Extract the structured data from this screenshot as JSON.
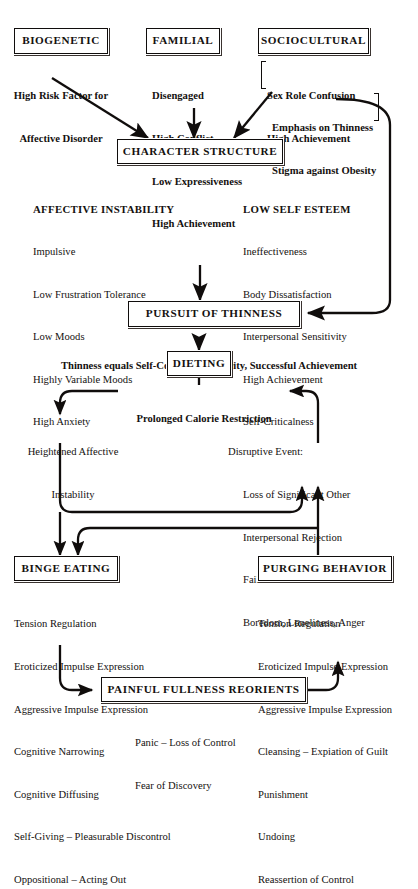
{
  "nodes": {
    "biogenetic": "BIOGENETIC",
    "familial": "FAMILIAL",
    "sociocultural": "SOCIOCULTURAL",
    "character_structure": "CHARACTER STRUCTURE",
    "pursuit_of_thinness": "PURSUIT OF THINNESS",
    "dieting": "DIETING",
    "binge_eating": "BINGE EATING",
    "purging_behavior": "PURGING BEHAVIOR",
    "painful_fullness": "PAINFUL FULLNESS REORIENTS"
  },
  "biogenetic_items": [
    "High Risk Factor for",
    "Affective Disorder"
  ],
  "familial_items": [
    "Disengaged",
    "High Conflict",
    "Low Expressiveness",
    "High Achievement"
  ],
  "sociocultural_group_a": [
    "Sex Role Confusion",
    "High Achievement"
  ],
  "sociocultural_group_b": [
    "Emphasis on Thinness",
    "Stigma against Obesity"
  ],
  "affective_instability": {
    "heading": "AFFECTIVE INSTABILITY",
    "items": [
      "Impulsive",
      "Low Frustration Tolerance",
      "Low Moods",
      "Highly Variable Moods",
      "High Anxiety"
    ]
  },
  "low_self_esteem": {
    "heading": "LOW SELF ESTEEM",
    "items": [
      "Ineffectiveness",
      "Body Dissatisfaction",
      "Interpersonal Sensitivity",
      "High Achievement",
      "Self-Criticalness"
    ]
  },
  "thinness_caption": "Thinness equals Self-Control, Popularity, Successful Achievement",
  "prolonged_calorie_restriction": "Prolonged Calorie Restriction",
  "heightened_affective": [
    "Heightened Affective",
    "Instability"
  ],
  "disruptive_event": {
    "heading": "Disruptive Event:",
    "items": [
      "Loss of Significant Other",
      "Interpersonal Rejection",
      "Failure",
      "Boredom, Loneliness, Anger"
    ]
  },
  "binge_items": [
    "Tension Regulation",
    "Eroticized Impulse Expression",
    "Aggressive Impulse Expression",
    "Cognitive Narrowing",
    "Cognitive Diffusing",
    "Self-Giving – Pleasurable Discontrol",
    "Oppositional – Acting Out"
  ],
  "purging_items": [
    "Tension Regulation",
    "Eroticized Impulse Expression",
    "Aggressive Impulse Expression",
    "Cleansing – Expiation of Guilt",
    "Punishment",
    "Undoing",
    "Reassertion of Control"
  ],
  "painful_items": [
    "Panic – Loss of Control",
    "Fear of Discovery"
  ],
  "colors": {
    "ink": "#100d0c",
    "paper": "#ffffff"
  }
}
